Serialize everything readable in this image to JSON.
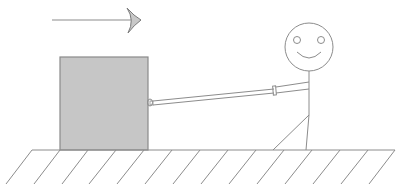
{
  "diagram": {
    "direction_arrow": {
      "direction": "right",
      "color": "#8c8c8c"
    },
    "box": {
      "fill": "#c6c6c6",
      "stroke": "#8a8a8a"
    },
    "rope": {
      "stroke": "#8c8c8c"
    },
    "person": {
      "stroke": "#8c8c8c",
      "expression": "smiling"
    },
    "ground": {
      "stroke": "#8c8c8c",
      "hatch_count": 9
    },
    "labels": {
      "arrow": "direction-of-pull",
      "box": "box",
      "rope": "rope",
      "person": "stick-figure",
      "ground": "ground"
    }
  }
}
